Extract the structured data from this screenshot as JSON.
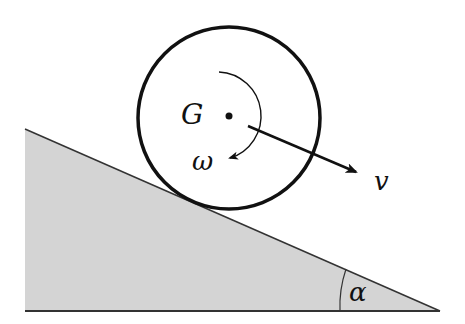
{
  "diagram": {
    "labels": {
      "center": "G",
      "angular_velocity": "ω",
      "velocity": "v",
      "angle": "α"
    },
    "colors": {
      "incline_fill": "#d4d4d4",
      "stroke": "#111111",
      "background": "#ffffff"
    }
  }
}
